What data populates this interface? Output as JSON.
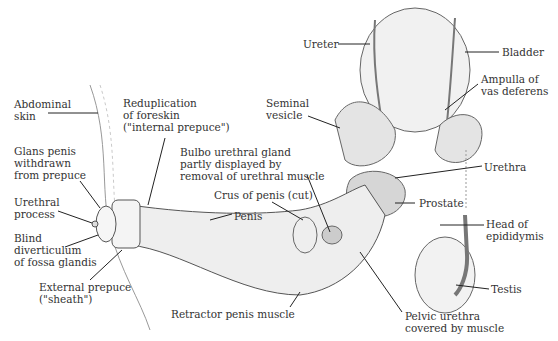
{
  "diagram": {
    "labels": [
      {
        "id": "abdominal-skin",
        "text": "Abdominal\nskin",
        "x": 14,
        "y": 98
      },
      {
        "id": "reduplication-foreskin",
        "text": "Reduplication\nof foreskin\n(\"internal prepuce\")",
        "x": 123,
        "y": 97
      },
      {
        "id": "glans-penis",
        "text": "Glans penis\nwithdrawn\nfrom prepuce",
        "x": 14,
        "y": 145
      },
      {
        "id": "urethral-process",
        "text": "Urethral\nprocess",
        "x": 14,
        "y": 196
      },
      {
        "id": "blind-diverticulum",
        "text": "Blind\ndiverticulum\nof fossa glandis",
        "x": 14,
        "y": 232
      },
      {
        "id": "external-prepuce",
        "text": "External prepuce\n(\"sheath\")",
        "x": 39,
        "y": 281
      },
      {
        "id": "bulbo-urethral-gland",
        "text": "Bulbo urethral gland\npartly displayed by\nremoval of urethral muscle",
        "x": 180,
        "y": 146
      },
      {
        "id": "crus-of-penis",
        "text": "Crus of penis (cut)",
        "x": 214,
        "y": 189
      },
      {
        "id": "penis",
        "text": "Penis",
        "x": 234,
        "y": 210
      },
      {
        "id": "retractor-penis-muscle",
        "text": "Retractor penis muscle",
        "x": 171,
        "y": 308
      },
      {
        "id": "ureter",
        "text": "Ureter",
        "x": 303,
        "y": 38
      },
      {
        "id": "bladder",
        "text": "Bladder",
        "x": 502,
        "y": 46
      },
      {
        "id": "seminal-vesicle",
        "text": "Seminal\nvesicle",
        "x": 266,
        "y": 97
      },
      {
        "id": "ampulla-vas-deferens",
        "text": "Ampulla of\nvas deferens",
        "x": 481,
        "y": 73
      },
      {
        "id": "urethra",
        "text": "Urethra",
        "x": 484,
        "y": 161
      },
      {
        "id": "prostate",
        "text": "Prostate",
        "x": 419,
        "y": 197
      },
      {
        "id": "head-of-epididymis",
        "text": "Head of\nepididymis",
        "x": 486,
        "y": 218
      },
      {
        "id": "testis",
        "text": "Testis",
        "x": 491,
        "y": 283
      },
      {
        "id": "pelvic-urethra",
        "text": "Pelvic urethra\ncovered by muscle",
        "x": 405,
        "y": 310
      }
    ]
  }
}
